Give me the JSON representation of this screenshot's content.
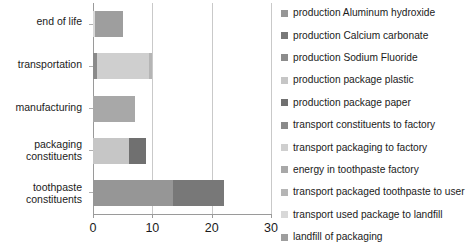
{
  "chart_data": {
    "type": "bar",
    "orientation": "horizontal",
    "stacked": true,
    "title": "",
    "xlabel": "",
    "ylabel": "",
    "xlim": [
      0,
      30
    ],
    "xticks": [
      0,
      10,
      20,
      30
    ],
    "xtick_labels": [
      "0",
      "10",
      "20",
      "30"
    ],
    "grid": true,
    "grid_axis": "x",
    "legend_position": "right",
    "categories": [
      "end of life",
      "transportation",
      "manufacturing",
      "packaging\nconstituents",
      "toothpaste\nconstituents"
    ],
    "category_totals": [
      5.0,
      10.0,
      7.0,
      9.0,
      22.0
    ],
    "series": [
      {
        "name": "production Aluminum hydroxide",
        "color": "#969696",
        "values": [
          0,
          0,
          0,
          0,
          13.5
        ]
      },
      {
        "name": "production Calcium carbonate",
        "color": "#787878",
        "values": [
          0,
          0,
          0,
          0,
          8.5
        ]
      },
      {
        "name": "production Sodium Fluoride",
        "color": "#8c8c8c",
        "values": [
          0,
          0,
          0,
          0,
          0
        ]
      },
      {
        "name": "production package plastic",
        "color": "#c6c6c6",
        "values": [
          0,
          0,
          0,
          6.0,
          0
        ]
      },
      {
        "name": "production package paper",
        "color": "#707070",
        "values": [
          0,
          0,
          0,
          3.0,
          0
        ]
      },
      {
        "name": "transport constituents to factory",
        "color": "#8a8a8a",
        "values": [
          0,
          0.6,
          0,
          0,
          0
        ]
      },
      {
        "name": "transport packaging to factory",
        "color": "#cfcfcf",
        "values": [
          0,
          8.9,
          0,
          0,
          0
        ]
      },
      {
        "name": "energy in toothpaste factory",
        "color": "#a8a8a8",
        "values": [
          0,
          0,
          7.0,
          0,
          0
        ]
      },
      {
        "name": "transport packaged toothpaste to user",
        "color": "#b5b5b5",
        "values": [
          0,
          0.5,
          0,
          0,
          0
        ]
      },
      {
        "name": "transport used package to landfill",
        "color": "#d8d8d8",
        "values": [
          0.4,
          0,
          0,
          0,
          0
        ]
      },
      {
        "name": "landfill of packaging",
        "color": "#9e9e9e",
        "values": [
          4.6,
          0,
          0,
          0,
          0
        ]
      }
    ]
  },
  "legend": {
    "items": [
      {
        "label": "production Aluminum hydroxide",
        "color": "#969696"
      },
      {
        "label": "production Calcium carbonate",
        "color": "#787878"
      },
      {
        "label": "production Sodium Fluoride",
        "color": "#8c8c8c"
      },
      {
        "label": "production package plastic",
        "color": "#c6c6c6"
      },
      {
        "label": "production package paper",
        "color": "#707070"
      },
      {
        "label": "transport constituents to factory",
        "color": "#8a8a8a"
      },
      {
        "label": "transport packaging to factory",
        "color": "#cfcfcf"
      },
      {
        "label": "energy in toothpaste factory",
        "color": "#a8a8a8"
      },
      {
        "label": "transport packaged toothpaste to user",
        "color": "#b5b5b5"
      },
      {
        "label": "transport used package to landfill",
        "color": "#d8d8d8"
      },
      {
        "label": "landfill of packaging",
        "color": "#9e9e9e"
      }
    ]
  }
}
